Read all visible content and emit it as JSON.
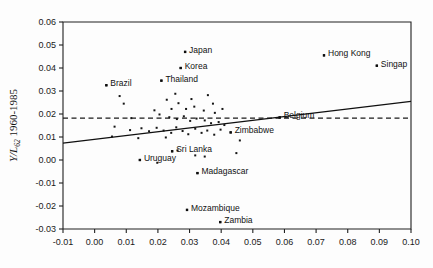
{
  "chart_data": {
    "type": "scatter",
    "title": "",
    "subtitle": "",
    "xlabel": "",
    "ylabel": "Y/L62 1960-1985",
    "ylabel_main": "Y/L",
    "ylabel_sub": "62",
    "ylabel_tail": " 1960-1985",
    "xlim": [
      -0.01,
      0.1
    ],
    "ylim": [
      -0.03,
      0.06
    ],
    "grid": false,
    "legend": "none",
    "xticks": [
      "-0.01",
      "0.00",
      "0.01",
      "0.02",
      "0.03",
      "0.04",
      "0.05",
      "0.06",
      "0.07",
      "0.08",
      "0.09",
      "0.10"
    ],
    "xtick_values": [
      -0.01,
      0.0,
      0.01,
      0.02,
      0.03,
      0.04,
      0.05,
      0.06,
      0.07,
      0.08,
      0.09,
      0.1
    ],
    "yticks": [
      "0.06",
      "0.05",
      "0.04",
      "0.03",
      "0.02",
      "0.01",
      "0.00",
      "-0.01",
      "-0.02",
      "-0.03"
    ],
    "ytick_values": [
      0.06,
      0.05,
      0.04,
      0.03,
      0.02,
      0.01,
      0.0,
      -0.01,
      -0.02,
      -0.03
    ],
    "regression_line": {
      "x0": -0.01,
      "y0": 0.0073,
      "x1": 0.1,
      "y1": 0.0255,
      "style": "solid"
    },
    "reference_line": {
      "y": 0.0182,
      "style": "dashed",
      "x0": -0.01,
      "x1": 0.1
    },
    "labeled_points": [
      {
        "label": "Japan",
        "x": 0.0286,
        "y": 0.047,
        "lx": 4,
        "ly": -2
      },
      {
        "label": "Korea",
        "x": 0.0272,
        "y": 0.04,
        "lx": 4,
        "ly": -2
      },
      {
        "label": "Thailand",
        "x": 0.0211,
        "y": 0.0345,
        "lx": 4,
        "ly": -2
      },
      {
        "label": "Brazil",
        "x": 0.0037,
        "y": 0.0325,
        "lx": 4,
        "ly": -2
      },
      {
        "label": "Hong Kong",
        "x": 0.0725,
        "y": 0.0455,
        "lx": 4,
        "ly": -2
      },
      {
        "label": "Singap",
        "x": 0.0892,
        "y": 0.041,
        "lx": 4,
        "ly": -2
      },
      {
        "label": "Belgium",
        "x": 0.0585,
        "y": 0.0185,
        "lx": 4,
        "ly": -2
      },
      {
        "label": "Zimbabwe",
        "x": 0.043,
        "y": 0.012,
        "lx": 4,
        "ly": -2
      },
      {
        "label": "Sri Lanka",
        "x": 0.0245,
        "y": 0.0038,
        "lx": 4,
        "ly": -2
      },
      {
        "label": "Uruguay",
        "x": 0.0143,
        "y": 0.0,
        "lx": 4,
        "ly": -2
      },
      {
        "label": "Madagascar",
        "x": 0.0325,
        "y": -0.0057,
        "lx": 4,
        "ly": -2
      },
      {
        "label": "Mozambique",
        "x": 0.0292,
        "y": -0.0217,
        "lx": 4,
        "ly": -2
      },
      {
        "label": "Zambia",
        "x": 0.0397,
        "y": -0.027,
        "lx": 4,
        "ly": -2
      }
    ],
    "points": [
      {
        "x": 0.0037,
        "y": 0.0325
      },
      {
        "x": 0.0211,
        "y": 0.0345
      },
      {
        "x": 0.0272,
        "y": 0.04
      },
      {
        "x": 0.0286,
        "y": 0.047
      },
      {
        "x": 0.0725,
        "y": 0.0455
      },
      {
        "x": 0.0892,
        "y": 0.041
      },
      {
        "x": 0.0079,
        "y": 0.0278
      },
      {
        "x": 0.0092,
        "y": 0.0245
      },
      {
        "x": 0.0255,
        "y": 0.0288
      },
      {
        "x": 0.0265,
        "y": 0.0247
      },
      {
        "x": 0.0306,
        "y": 0.0265
      },
      {
        "x": 0.0358,
        "y": 0.0282
      },
      {
        "x": 0.0228,
        "y": 0.0262
      },
      {
        "x": 0.0243,
        "y": 0.0222
      },
      {
        "x": 0.0289,
        "y": 0.0222
      },
      {
        "x": 0.0315,
        "y": 0.0232
      },
      {
        "x": 0.0345,
        "y": 0.0215
      },
      {
        "x": 0.0374,
        "y": 0.0245
      },
      {
        "x": 0.038,
        "y": 0.0205
      },
      {
        "x": 0.0404,
        "y": 0.0222
      },
      {
        "x": 0.0189,
        "y": 0.0216
      },
      {
        "x": 0.0205,
        "y": 0.0198
      },
      {
        "x": 0.0236,
        "y": 0.0186
      },
      {
        "x": 0.026,
        "y": 0.0178
      },
      {
        "x": 0.0282,
        "y": 0.019
      },
      {
        "x": 0.0302,
        "y": 0.017
      },
      {
        "x": 0.0322,
        "y": 0.018
      },
      {
        "x": 0.0348,
        "y": 0.0172
      },
      {
        "x": 0.0368,
        "y": 0.016
      },
      {
        "x": 0.0392,
        "y": 0.0165
      },
      {
        "x": 0.041,
        "y": 0.0152
      },
      {
        "x": 0.043,
        "y": 0.012
      },
      {
        "x": 0.0585,
        "y": 0.0185
      },
      {
        "x": 0.0063,
        "y": 0.0145
      },
      {
        "x": 0.0112,
        "y": 0.013
      },
      {
        "x": 0.0148,
        "y": 0.0138
      },
      {
        "x": 0.0172,
        "y": 0.0125
      },
      {
        "x": 0.0196,
        "y": 0.014
      },
      {
        "x": 0.0218,
        "y": 0.0128
      },
      {
        "x": 0.0242,
        "y": 0.0118
      },
      {
        "x": 0.0258,
        "y": 0.0142
      },
      {
        "x": 0.0278,
        "y": 0.0126
      },
      {
        "x": 0.0296,
        "y": 0.0112
      },
      {
        "x": 0.0318,
        "y": 0.0136
      },
      {
        "x": 0.0338,
        "y": 0.0118
      },
      {
        "x": 0.0356,
        "y": 0.0128
      },
      {
        "x": 0.0378,
        "y": 0.011
      },
      {
        "x": 0.0398,
        "y": 0.0132
      },
      {
        "x": 0.0138,
        "y": 0.0095
      },
      {
        "x": 0.0225,
        "y": 0.0098
      },
      {
        "x": 0.0245,
        "y": 0.0038
      },
      {
        "x": 0.0262,
        "y": 0.0042
      },
      {
        "x": 0.0143,
        "y": 0.0
      },
      {
        "x": 0.0198,
        "y": -0.0012
      },
      {
        "x": 0.0325,
        "y": -0.0057
      },
      {
        "x": 0.0318,
        "y": 0.002
      },
      {
        "x": 0.0348,
        "y": 0.0015
      },
      {
        "x": 0.0459,
        "y": 0.0085
      },
      {
        "x": 0.0448,
        "y": 0.003
      },
      {
        "x": 0.0292,
        "y": -0.0217
      },
      {
        "x": 0.0397,
        "y": -0.027
      },
      {
        "x": 0.0116,
        "y": 0.0182
      },
      {
        "x": 0.0055,
        "y": 0.0102
      }
    ]
  }
}
